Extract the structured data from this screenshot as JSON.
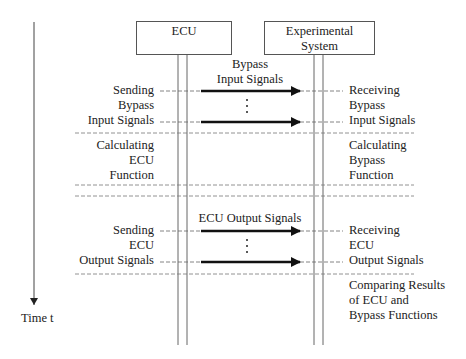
{
  "diagram": {
    "type": "sequence-diagram",
    "time_axis": {
      "label": "Time t"
    },
    "participants": [
      {
        "id": "ecu",
        "label": "ECU"
      },
      {
        "id": "experimental",
        "label": "Experimental System",
        "label_lines": [
          "Experimental",
          "System"
        ]
      }
    ],
    "messages": [
      {
        "label_lines": [
          "Bypass",
          "Input Signals"
        ],
        "from": "ecu",
        "to": "experimental",
        "arrows": 2,
        "ellipsis": "⋮"
      },
      {
        "label_lines": [
          "ECU Output Signals"
        ],
        "from": "ecu",
        "to": "experimental",
        "arrows": 2,
        "ellipsis": "⋮"
      }
    ],
    "left_steps": [
      {
        "lines": [
          "Sending",
          "Bypass",
          "Input Signals"
        ]
      },
      {
        "lines": [
          "Calculating",
          "ECU",
          "Function"
        ]
      },
      {
        "lines": [
          "Sending",
          "ECU",
          "Output Signals"
        ]
      }
    ],
    "right_steps": [
      {
        "lines": [
          "Receiving",
          "Bypass",
          "Input Signals"
        ]
      },
      {
        "lines": [
          "Calculating",
          "Bypass",
          "Function"
        ]
      },
      {
        "lines": [
          "Receiving",
          "ECU",
          "Output Signals"
        ]
      },
      {
        "lines": [
          "Comparing Results",
          "of ECU and",
          "Bypass Functions"
        ]
      }
    ]
  }
}
